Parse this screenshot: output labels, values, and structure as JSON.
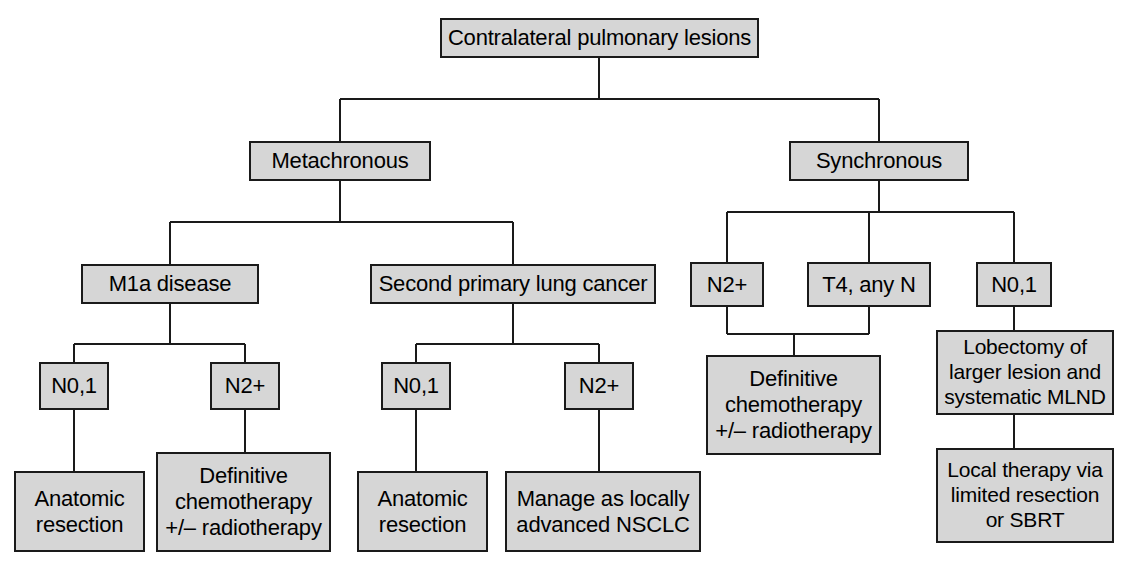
{
  "diagram": {
    "type": "flowchart",
    "colors": {
      "node_fill": "#d6d6d6",
      "node_border": "#1a1a1a",
      "connector": "#1a1a1a",
      "text": "#000000",
      "background": "#ffffff"
    },
    "nodes": {
      "root": "Contralateral pulmonary lesions",
      "metachronous": "Metachronous",
      "synchronous": "Synchronous",
      "m1a_disease": "M1a disease",
      "second_primary": "Second primary lung cancer",
      "sync_n2plus": "N2+",
      "sync_t4": "T4, any N",
      "sync_n01": "N0,1",
      "m1a_n01": "N0,1",
      "m1a_n2plus": "N2+",
      "splc_n01": "N0,1",
      "splc_n2plus": "N2+",
      "anatomic_resection_a": "Anatomic\nresection",
      "definitive_chemo_a": "Definitive\nchemotherapy\n+/– radiotherapy",
      "anatomic_resection_b": "Anatomic\nresection",
      "manage_nsclc": "Manage as locally\nadvanced NSCLC",
      "definitive_chemo_b": "Definitive\nchemotherapy\n+/– radiotherapy",
      "lobectomy": "Lobectomy of\nlarger lesion and\nsystematic MLND",
      "local_therapy": "Local therapy via\nlimited resection\nor SBRT"
    },
    "edges": [
      {
        "from": "root",
        "to": "metachronous"
      },
      {
        "from": "root",
        "to": "synchronous"
      },
      {
        "from": "metachronous",
        "to": "m1a_disease"
      },
      {
        "from": "metachronous",
        "to": "second_primary"
      },
      {
        "from": "synchronous",
        "to": "sync_n2plus"
      },
      {
        "from": "synchronous",
        "to": "sync_t4"
      },
      {
        "from": "synchronous",
        "to": "sync_n01"
      },
      {
        "from": "m1a_disease",
        "to": "m1a_n01"
      },
      {
        "from": "m1a_disease",
        "to": "m1a_n2plus"
      },
      {
        "from": "second_primary",
        "to": "splc_n01"
      },
      {
        "from": "second_primary",
        "to": "splc_n2plus"
      },
      {
        "from": "m1a_n01",
        "to": "anatomic_resection_a"
      },
      {
        "from": "m1a_n2plus",
        "to": "definitive_chemo_a"
      },
      {
        "from": "splc_n01",
        "to": "anatomic_resection_b"
      },
      {
        "from": "splc_n2plus",
        "to": "manage_nsclc"
      },
      {
        "from": "sync_n2plus",
        "to": "definitive_chemo_b"
      },
      {
        "from": "sync_t4",
        "to": "definitive_chemo_b"
      },
      {
        "from": "sync_n01",
        "to": "lobectomy"
      },
      {
        "from": "lobectomy",
        "to": "local_therapy"
      }
    ]
  }
}
